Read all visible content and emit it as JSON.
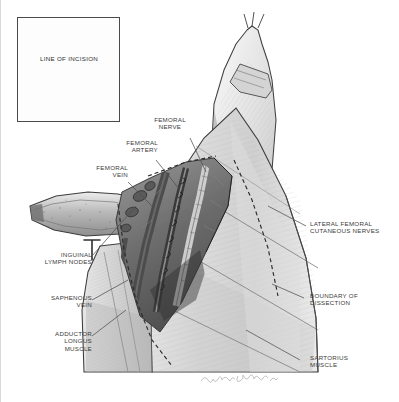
{
  "figure": {
    "kind": "medical-illustration",
    "background_color": "#ffffff",
    "ink_color": "#3b3b3b",
    "border_color": "#d9d9d9"
  },
  "inset": {
    "name": "line-of-incision-inset",
    "caption": "LINE OF INCISION",
    "description": "Frontal view of lower torso and groin showing the planned skin incision",
    "border_color": "#4a4a4a"
  },
  "labels": {
    "femoral_nerve": "FEMORAL\nNERVE",
    "femoral_artery": "FEMORAL\nARTERY",
    "femoral_vein": "FEMORAL\nVEIN",
    "lateral_femoral_cutaneous_nerves": "LATERAL FEMORAL\nCUTANEOUS NERVES",
    "inguinal_lymph_nodes": "INGUINAL\nLYMPH NODES",
    "saphenous_vein": "SAPHENOUS\nVEIN",
    "adductor_longus_muscle": "ADDUCTOR\nLONGUS\nMUSCLE",
    "boundary_of_dissection": "BOUNDARY OF\nDISSECTION",
    "sartorius_muscle": "SARTORIUS\nMUSCLE"
  },
  "signature": {
    "text": "artist signature",
    "legible": false
  }
}
